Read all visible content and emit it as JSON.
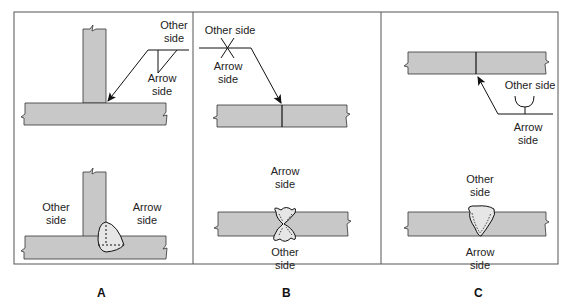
{
  "figure": {
    "plate_color": "#c8c8c8",
    "weld_color": "#e6e6e6",
    "line_color": "#111111",
    "frame_color": "#555555"
  },
  "panels": [
    {
      "letter": "A",
      "top_labels": {
        "other_side_1": "Other",
        "other_side_2": "side",
        "arrow_side_1": "Arrow",
        "arrow_side_2": "side"
      },
      "bottom_labels": {
        "other_side_1": "Other",
        "other_side_2": "side",
        "arrow_side_1": "Arrow",
        "arrow_side_2": "side"
      }
    },
    {
      "letter": "B",
      "top_labels": {
        "other_side": "Other side",
        "arrow_side_1": "Arrow",
        "arrow_side_2": "side"
      },
      "bottom_labels": {
        "arrow_side_1": "Arrow",
        "arrow_side_2": "side",
        "other_side_1": "Other",
        "other_side_2": "side"
      }
    },
    {
      "letter": "C",
      "top_labels": {
        "other_side": "Other side",
        "arrow_side_1": "Arrow",
        "arrow_side_2": "side"
      },
      "bottom_labels": {
        "other_side_1": "Other",
        "other_side_2": "side",
        "arrow_side_1": "Arrow",
        "arrow_side_2": "side"
      }
    }
  ]
}
